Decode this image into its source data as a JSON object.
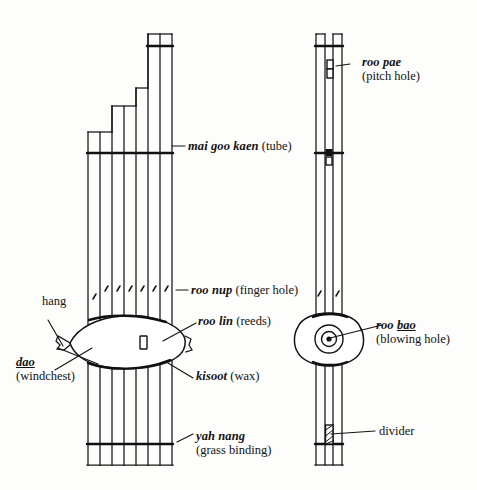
{
  "figure": {
    "views": [
      {
        "id": "front-view",
        "name": "front view",
        "tube_count": 7
      },
      {
        "id": "side-view",
        "name": "side view",
        "tube_count": 2
      }
    ],
    "ink_color": "#141414",
    "background_color": "#fdfdfb"
  },
  "labels": {
    "mai_goo_kaen": {
      "thai": "mai goo kaen",
      "gloss": "(tube)",
      "target": "front-view-tube"
    },
    "roo_nup": {
      "thai": "roo nup",
      "gloss": "(finger hole)",
      "target": "front-view-finger-holes"
    },
    "roo_lin": {
      "thai": "roo lin",
      "gloss": "(reeds)",
      "target": "front-view-reed-slot"
    },
    "kisoot": {
      "thai": "kisoot",
      "gloss": "(wax)",
      "target": "front-view-wax-band"
    },
    "yah_nang": {
      "thai": "yah nang",
      "gloss": "(grass binding)",
      "target": "front-view-grass-binding"
    },
    "hang": {
      "plain": "hang",
      "target": "front-view-windchest-tip"
    },
    "dao": {
      "thai": "dao",
      "gloss": "(windchest)",
      "target": "front-view-windchest"
    },
    "roo_pae": {
      "thai": "roo pae",
      "gloss": "(pitch hole)",
      "target": "side-view-pitch-hole"
    },
    "roo_bao": {
      "thai_pre": "roo ",
      "thai_underlined": "bao",
      "gloss": "(blowing hole)",
      "target": "side-view-blowing-hole"
    },
    "divider": {
      "plain": "divider",
      "target": "side-view-divider"
    }
  }
}
